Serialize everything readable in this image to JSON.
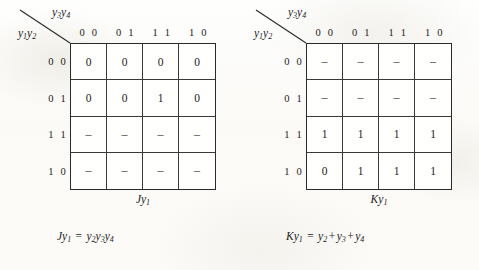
{
  "figure": {
    "type": "karnaugh-map-pair",
    "maps": [
      {
        "id": "jy1",
        "corner": {
          "column_variable": "y3y4",
          "column_variable_base": "y",
          "column_variable_subs": [
            "3",
            "4"
          ],
          "row_variable": "y1y2",
          "row_variable_base": "y",
          "row_variable_subs": [
            "1",
            "2"
          ]
        },
        "column_headers": [
          "0 0",
          "0 1",
          "1 1",
          "1 0"
        ],
        "row_headers": [
          "0 0",
          "0 1",
          "1 1",
          "1 0"
        ],
        "cells": [
          [
            "0",
            "0",
            "0",
            "0"
          ],
          [
            "0",
            "0",
            "1",
            "0"
          ],
          [
            "–",
            "–",
            "–",
            "–"
          ],
          [
            "–",
            "–",
            "–",
            "–"
          ]
        ],
        "caption": "Jy1",
        "caption_base": "Jy",
        "caption_sub": "1",
        "equation": {
          "lhs_base": "Jy",
          "lhs_sub": "1",
          "equals": "=",
          "terms": [
            {
              "base": "y",
              "sub": "2"
            },
            {
              "base": "y",
              "sub": "3"
            },
            {
              "base": "y",
              "sub": "4"
            }
          ],
          "operators": [
            "",
            "",
            ""
          ],
          "text": "Jy1 = y2y3y4"
        }
      },
      {
        "id": "ky1",
        "corner": {
          "column_variable": "y3y4",
          "column_variable_base": "y",
          "column_variable_subs": [
            "3",
            "4"
          ],
          "row_variable": "y1y2",
          "row_variable_base": "y",
          "row_variable_subs": [
            "1",
            "2"
          ]
        },
        "column_headers": [
          "0 0",
          "0 1",
          "1 1",
          "1 0"
        ],
        "row_headers": [
          "0 0",
          "0 1",
          "1 1",
          "1 0"
        ],
        "cells": [
          [
            "–",
            "–",
            "–",
            "–"
          ],
          [
            "–",
            "–",
            "–",
            "–"
          ],
          [
            "1",
            "1",
            "1",
            "1"
          ],
          [
            "0",
            "1",
            "1",
            "1"
          ]
        ],
        "caption": "Ky1",
        "caption_base": "Ky",
        "caption_sub": "1",
        "equation": {
          "lhs_base": "Ky",
          "lhs_sub": "1",
          "equals": "=",
          "terms": [
            {
              "base": "y",
              "sub": "2"
            },
            {
              "base": "y",
              "sub": "3"
            },
            {
              "base": "y",
              "sub": "4"
            }
          ],
          "operators": [
            "",
            "+",
            "+"
          ],
          "text": "Ky1 = y2 + y3 + y4"
        }
      }
    ]
  },
  "colors": {
    "ink": "#1c1c1c",
    "grid_line": "#3a3a3a",
    "grid_border": "#2a2a2a",
    "paper": "#fdfdfb"
  }
}
